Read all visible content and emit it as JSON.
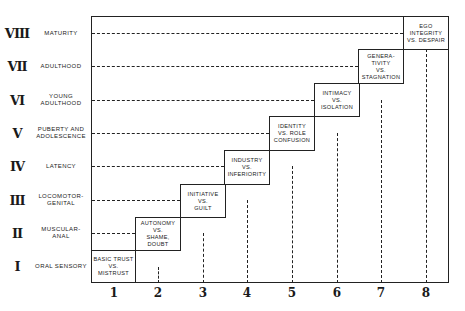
{
  "diagram": {
    "title": "",
    "rows": [
      {
        "roman": "VIII",
        "name": "MATURITY"
      },
      {
        "roman": "VII",
        "name": "ADULTHOOD"
      },
      {
        "roman": "VI",
        "name": "YOUNG ADULTHOOD"
      },
      {
        "roman": "V",
        "name": "PUBERTY AND ADOLESCENCE"
      },
      {
        "roman": "IV",
        "name": "LATENCY"
      },
      {
        "roman": "III",
        "name": "LOCOMOTOR- GENITAL"
      },
      {
        "roman": "II",
        "name": "MUSCULAR- ANAL"
      },
      {
        "roman": "I",
        "name": "ORAL SENSORY"
      }
    ],
    "columns": [
      "1",
      "2",
      "3",
      "4",
      "5",
      "6",
      "7",
      "8"
    ],
    "stages": [
      {
        "stage": 1,
        "text": "BASIC TRUST\nVS.\nMISTRUST"
      },
      {
        "stage": 2,
        "text": "AUTONOMY\nVS.\nSHAME,\nDOUBT"
      },
      {
        "stage": 3,
        "text": "INITIATIVE\nVS.\nGUILT"
      },
      {
        "stage": 4,
        "text": "INDUSTRY\nVS.\nINFERIORITY"
      },
      {
        "stage": 5,
        "text": "IDENTITY\nVS. ROLE\nCONFUSION"
      },
      {
        "stage": 6,
        "text": "INTIMACY\nVS.\nISOLATION"
      },
      {
        "stage": 7,
        "text": "GENERA-\nTIVITY\nVS.\nSTAGNATION"
      },
      {
        "stage": 8,
        "text": "EGO\nINTEGRITY\nVS. DESPAIR"
      }
    ],
    "colors": {
      "ink": "#222222",
      "background": "#ffffff"
    }
  }
}
